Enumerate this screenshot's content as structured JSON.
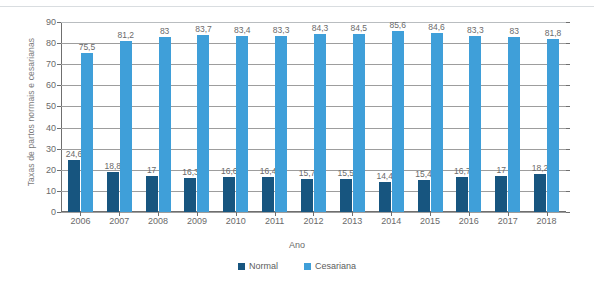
{
  "chart_data": {
    "type": "bar",
    "title": "",
    "xlabel": "Ano",
    "ylabel": "Taxas de partos normais e cesarianas",
    "categories": [
      "2006",
      "2007",
      "2008",
      "2009",
      "2010",
      "2011",
      "2012",
      "2013",
      "2014",
      "2015",
      "2016",
      "2017",
      "2018"
    ],
    "series": [
      {
        "name": "Normal",
        "color": "#17557f",
        "values": [
          24.6,
          18.8,
          17,
          16.3,
          16.6,
          16.4,
          15.7,
          15.5,
          14.4,
          15.4,
          16.7,
          17,
          18.2
        ],
        "labels": [
          "24,6",
          "18,8",
          "17",
          "16,3",
          "16,6",
          "16,4",
          "15,7",
          "15,5",
          "14,4",
          "15,4",
          "16,7",
          "17",
          "18,2"
        ]
      },
      {
        "name": "Cesariana",
        "color": "#3f9fd9",
        "values": [
          75.5,
          81.2,
          83,
          83.7,
          83.4,
          83.3,
          84.3,
          84.5,
          85.6,
          84.6,
          83.3,
          83,
          81.8
        ],
        "labels": [
          "75,5",
          "81,2",
          "83",
          "83,7",
          "83,4",
          "83,3",
          "84,3",
          "84,5",
          "85,6",
          "84,6",
          "83,3",
          "83",
          "81,8"
        ]
      }
    ],
    "ylim": [
      0,
      90
    ],
    "ytick_step": 10,
    "yticks": [
      "90",
      "80",
      "70",
      "60",
      "50",
      "40",
      "30",
      "20",
      "10",
      "0"
    ],
    "grid": true,
    "legend_position": "bottom"
  },
  "legend": {
    "items": [
      {
        "label": "Normal"
      },
      {
        "label": "Cesariana"
      }
    ]
  }
}
